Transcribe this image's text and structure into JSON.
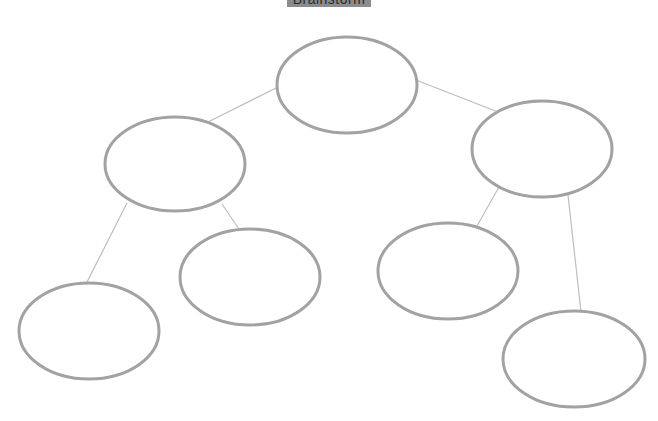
{
  "title": {
    "label": "Brainstorm",
    "background": "#8c8c8c"
  },
  "style": {
    "ellipse_stroke": "#a2a2a2",
    "connector_stroke": "#bdbdbd",
    "background": "#ffffff"
  },
  "nodes": [
    {
      "id": "root",
      "label": "",
      "cx": 347,
      "cy": 85,
      "rx": 70,
      "ry": 48
    },
    {
      "id": "left",
      "label": "",
      "cx": 175,
      "cy": 164,
      "rx": 70,
      "ry": 47
    },
    {
      "id": "right",
      "label": "",
      "cx": 542,
      "cy": 149,
      "rx": 70,
      "ry": 48
    },
    {
      "id": "left-left",
      "label": "",
      "cx": 89,
      "cy": 331,
      "rx": 70,
      "ry": 48
    },
    {
      "id": "left-right",
      "label": "",
      "cx": 250,
      "cy": 277,
      "rx": 70,
      "ry": 48
    },
    {
      "id": "right-left",
      "label": "",
      "cx": 448,
      "cy": 271,
      "rx": 70,
      "ry": 48
    },
    {
      "id": "right-right",
      "label": "",
      "cx": 574,
      "cy": 359,
      "rx": 71,
      "ry": 48
    }
  ],
  "edges": [
    {
      "from": "root",
      "to": "left",
      "x1": 278,
      "y1": 87,
      "x2": 208,
      "y2": 122
    },
    {
      "from": "root",
      "to": "right",
      "x1": 416,
      "y1": 80,
      "x2": 498,
      "y2": 112
    },
    {
      "from": "left",
      "to": "left-left",
      "x1": 127,
      "y1": 203,
      "x2": 86,
      "y2": 284
    },
    {
      "from": "left",
      "to": "left-right",
      "x1": 222,
      "y1": 204,
      "x2": 239,
      "y2": 229
    },
    {
      "from": "right",
      "to": "right-left",
      "x1": 499,
      "y1": 187,
      "x2": 477,
      "y2": 226
    },
    {
      "from": "right",
      "to": "right-right",
      "x1": 568,
      "y1": 195,
      "x2": 581,
      "y2": 312
    }
  ]
}
